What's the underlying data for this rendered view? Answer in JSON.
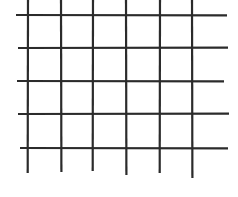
{
  "diagram": {
    "type": "grid",
    "line_color": "#2b2b2b",
    "background_color": "#ffffff",
    "stroke_width": 2.2,
    "vertical_lines": [
      {
        "x": 28,
        "y1": 0,
        "y2": 173
      },
      {
        "x": 61,
        "y1": 0,
        "y2": 172
      },
      {
        "x": 93,
        "y1": 0,
        "y2": 171
      },
      {
        "x": 126,
        "y1": 0,
        "y2": 175
      },
      {
        "x": 160,
        "y1": 0,
        "y2": 173
      },
      {
        "x": 192,
        "y1": 0,
        "y2": 178
      }
    ],
    "horizontal_lines": [
      {
        "y": 15,
        "x1": 16,
        "x2": 227
      },
      {
        "y": 48,
        "x1": 18,
        "x2": 228
      },
      {
        "y": 81,
        "x1": 17,
        "x2": 224
      },
      {
        "y": 114,
        "x1": 18,
        "x2": 229
      },
      {
        "y": 148,
        "x1": 20,
        "x2": 228
      }
    ],
    "rows": 4,
    "columns": 5
  }
}
